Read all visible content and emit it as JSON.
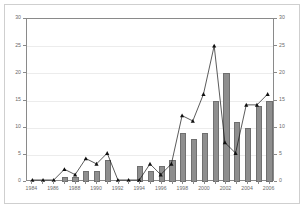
{
  "chart_data": {
    "type": "bar",
    "title": "",
    "subtitle": "",
    "xlabel": "",
    "ylabel": "",
    "ylim": [
      0,
      30
    ],
    "y2lim": [
      0,
      30
    ],
    "grid": true,
    "legend_position": "top-left",
    "categories": [
      "1984",
      "1985",
      "1986",
      "1987",
      "1988",
      "1989",
      "1990",
      "1991",
      "1992",
      "1993",
      "1994",
      "1995",
      "1996",
      "1997",
      "1998",
      "1999",
      "2000",
      "2001",
      "2002",
      "2003",
      "2004",
      "2005",
      "2006"
    ],
    "x_tick_labels": [
      "1984",
      "1986",
      "1988",
      "1990",
      "1992",
      "1994",
      "1996",
      "1998",
      "2000",
      "2002",
      "2004",
      "2006"
    ],
    "y_tick_labels": [
      "0",
      "5",
      "10",
      "15",
      "20",
      "25",
      "30"
    ],
    "y2_tick_labels": [
      "0",
      "5",
      "10",
      "15",
      "20",
      "25",
      "30"
    ],
    "series": [
      {
        "name": "Pairs",
        "type": "bar",
        "axis": "left",
        "color": "#8e8e8e",
        "values": [
          0,
          0,
          0,
          1,
          1,
          2,
          2,
          4,
          0,
          0,
          3,
          2,
          3,
          4,
          9,
          8,
          9,
          15,
          20,
          11,
          10,
          14,
          15
        ]
      },
      {
        "name": "Young",
        "type": "line",
        "axis": "right",
        "color": "#111111",
        "marker": "triangle",
        "values": [
          0,
          0,
          0,
          2,
          1,
          4,
          3,
          5,
          0,
          0,
          0,
          3,
          1,
          3,
          12,
          11,
          16,
          25,
          7,
          5,
          14,
          14,
          16
        ]
      }
    ]
  },
  "legend": {
    "entries": [
      {
        "label": "Pairs",
        "marker": "bar-swatch"
      },
      {
        "label": "Young",
        "marker": "line-triangle-swatch"
      }
    ]
  }
}
